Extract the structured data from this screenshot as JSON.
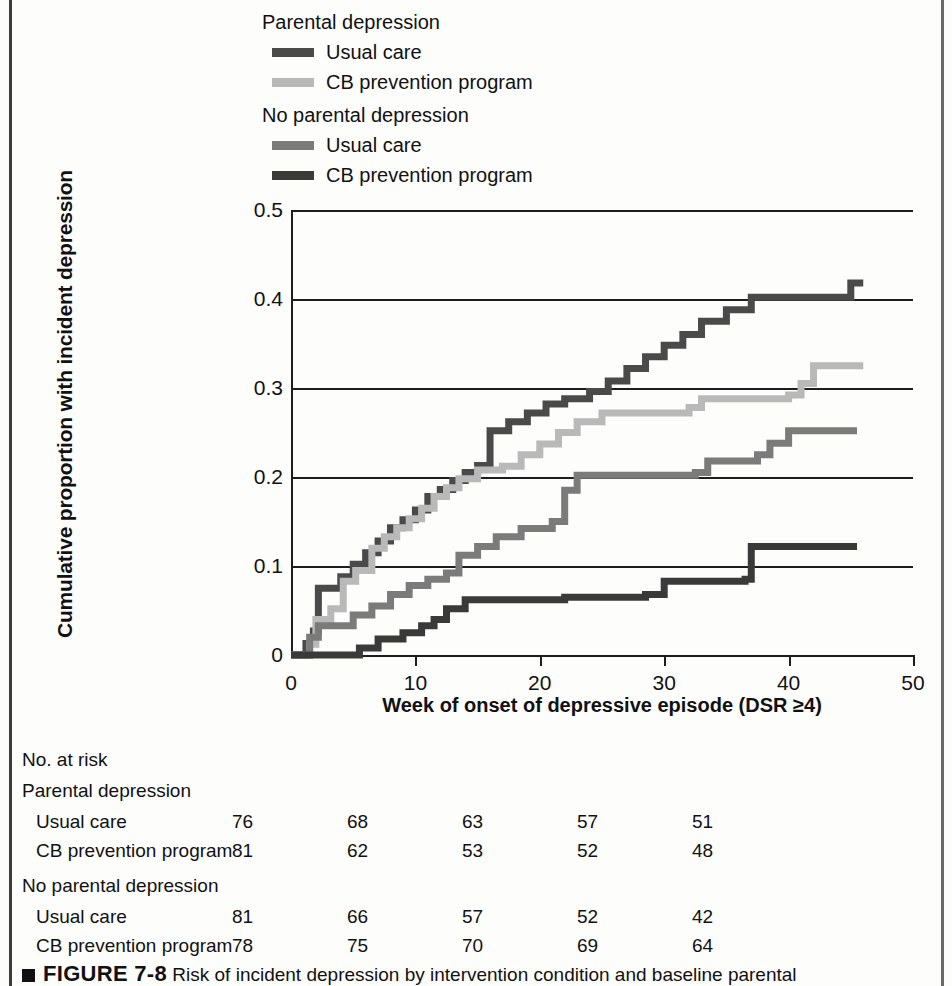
{
  "figure": {
    "caption_marker": "square-bullet",
    "figure_number": "FIGURE 7-8",
    "caption_text": "Risk of incident depression by intervention condition and baseline parental"
  },
  "legend": {
    "groups": [
      {
        "title": "Parental depression",
        "items": [
          {
            "label": "Usual care",
            "color": "#4a4a4a"
          },
          {
            "label": "CB prevention program",
            "color": "#b9b9b9"
          }
        ]
      },
      {
        "title": "No parental depression",
        "items": [
          {
            "label": "Usual care",
            "color": "#7b7b7b"
          },
          {
            "label": "CB prevention program",
            "color": "#3a3a3a"
          }
        ]
      }
    ]
  },
  "at_risk": {
    "title": "No. at risk",
    "groups": [
      {
        "name": "Parental depression",
        "rows": [
          {
            "label": "Usual care",
            "values": [
              "76",
              "68",
              "63",
              "57",
              "51"
            ]
          },
          {
            "label": "CB prevention program",
            "values": [
              "81",
              "62",
              "53",
              "52",
              "48"
            ]
          }
        ]
      },
      {
        "name": "No parental depression",
        "rows": [
          {
            "label": "Usual care",
            "values": [
              "81",
              "66",
              "57",
              "52",
              "42"
            ]
          },
          {
            "label": "CB prevention program",
            "values": [
              "78",
              "75",
              "70",
              "69",
              "64"
            ]
          }
        ]
      }
    ]
  },
  "chart_data": {
    "type": "line",
    "title": "",
    "xlabel": "Week of onset of depressive episode (DSR ≥4)",
    "ylabel": "Cumulative proportion with incident depression",
    "xlim": [
      0,
      50
    ],
    "ylim": [
      0,
      0.5
    ],
    "xticks": [
      0,
      10,
      20,
      30,
      40,
      50
    ],
    "xtick_labels": [
      "0",
      "10",
      "20",
      "30",
      "40",
      "50"
    ],
    "yticks": [
      0,
      0.1,
      0.2,
      0.3,
      0.4,
      0.5
    ],
    "ytick_labels": [
      "0",
      "0.1",
      "0.2",
      "0.3",
      "0.4",
      "0.5"
    ],
    "grid": "horizontal",
    "legend_position": "above-plot",
    "step_style": "post",
    "series": [
      {
        "name": "Parental depression - Usual care",
        "color": "#4a4a4a",
        "points": [
          [
            0,
            0.0
          ],
          [
            1.2,
            0.013
          ],
          [
            1.8,
            0.027
          ],
          [
            2.2,
            0.075
          ],
          [
            4.0,
            0.088
          ],
          [
            5.0,
            0.102
          ],
          [
            6.0,
            0.115
          ],
          [
            7.0,
            0.128
          ],
          [
            8.0,
            0.143
          ],
          [
            9.0,
            0.152
          ],
          [
            10.0,
            0.163
          ],
          [
            11.0,
            0.178
          ],
          [
            12.0,
            0.186
          ],
          [
            13.0,
            0.196
          ],
          [
            14.0,
            0.205
          ],
          [
            15.0,
            0.213
          ],
          [
            16.0,
            0.252
          ],
          [
            17.5,
            0.262
          ],
          [
            19.0,
            0.272
          ],
          [
            20.5,
            0.282
          ],
          [
            22.0,
            0.288
          ],
          [
            24.0,
            0.296
          ],
          [
            25.5,
            0.308
          ],
          [
            27.0,
            0.322
          ],
          [
            28.5,
            0.335
          ],
          [
            30.0,
            0.348
          ],
          [
            31.5,
            0.36
          ],
          [
            33.0,
            0.375
          ],
          [
            35.0,
            0.388
          ],
          [
            37.0,
            0.402
          ],
          [
            44.5,
            0.402
          ],
          [
            45.0,
            0.418
          ],
          [
            46.0,
            0.418
          ]
        ]
      },
      {
        "name": "Parental depression - CB prevention program",
        "color": "#b9b9b9",
        "points": [
          [
            0,
            0.0
          ],
          [
            1.5,
            0.012
          ],
          [
            2.0,
            0.04
          ],
          [
            3.2,
            0.052
          ],
          [
            4.2,
            0.083
          ],
          [
            5.2,
            0.095
          ],
          [
            6.5,
            0.12
          ],
          [
            7.5,
            0.133
          ],
          [
            8.5,
            0.143
          ],
          [
            9.5,
            0.153
          ],
          [
            10.5,
            0.165
          ],
          [
            11.5,
            0.178
          ],
          [
            12.5,
            0.188
          ],
          [
            13.5,
            0.198
          ],
          [
            15.0,
            0.208
          ],
          [
            17.0,
            0.212
          ],
          [
            18.5,
            0.225
          ],
          [
            20.0,
            0.237
          ],
          [
            21.5,
            0.25
          ],
          [
            23.0,
            0.262
          ],
          [
            25.0,
            0.272
          ],
          [
            32.0,
            0.278
          ],
          [
            33.0,
            0.288
          ],
          [
            40.0,
            0.292
          ],
          [
            41.0,
            0.305
          ],
          [
            42.0,
            0.325
          ],
          [
            46.0,
            0.325
          ]
        ]
      },
      {
        "name": "No parental depression - Usual care",
        "color": "#7b7b7b",
        "points": [
          [
            0,
            0.0
          ],
          [
            1.5,
            0.02
          ],
          [
            2.2,
            0.033
          ],
          [
            4.5,
            0.033
          ],
          [
            5.0,
            0.045
          ],
          [
            6.5,
            0.055
          ],
          [
            8.0,
            0.068
          ],
          [
            9.5,
            0.078
          ],
          [
            11.0,
            0.085
          ],
          [
            12.5,
            0.092
          ],
          [
            13.5,
            0.112
          ],
          [
            15.0,
            0.122
          ],
          [
            16.5,
            0.133
          ],
          [
            18.5,
            0.142
          ],
          [
            21.0,
            0.15
          ],
          [
            22.0,
            0.185
          ],
          [
            23.0,
            0.202
          ],
          [
            32.5,
            0.205
          ],
          [
            33.5,
            0.218
          ],
          [
            37.5,
            0.225
          ],
          [
            38.5,
            0.238
          ],
          [
            40.0,
            0.252
          ],
          [
            45.5,
            0.252
          ]
        ]
      },
      {
        "name": "No parental depression - CB prevention program",
        "color": "#3a3a3a",
        "points": [
          [
            0,
            0.0
          ],
          [
            5.0,
            0.0
          ],
          [
            5.5,
            0.008
          ],
          [
            7.0,
            0.018
          ],
          [
            9.0,
            0.025
          ],
          [
            10.5,
            0.033
          ],
          [
            11.5,
            0.04
          ],
          [
            12.5,
            0.052
          ],
          [
            14.0,
            0.062
          ],
          [
            21.0,
            0.062
          ],
          [
            22.0,
            0.065
          ],
          [
            28.5,
            0.068
          ],
          [
            30.0,
            0.083
          ],
          [
            36.5,
            0.085
          ],
          [
            37.0,
            0.122
          ],
          [
            45.5,
            0.122
          ]
        ]
      }
    ]
  }
}
